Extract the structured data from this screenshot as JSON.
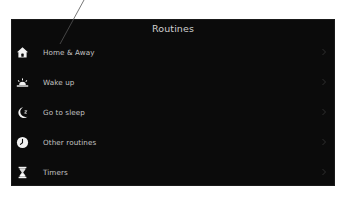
{
  "screen": {
    "title": "Routines",
    "background": "#0b0b0b",
    "text_color": "#c4c4c4",
    "title_color": "#cfcfcf",
    "page_background": "#ffffff"
  },
  "routines": {
    "items": [
      {
        "label": "Home & Away",
        "icon": "home-icon"
      },
      {
        "label": "Wake up",
        "icon": "sunrise-icon"
      },
      {
        "label": "Go to sleep",
        "icon": "moon-sleep-icon"
      },
      {
        "label": "Other routines",
        "icon": "clock-icon"
      },
      {
        "label": "Timers",
        "icon": "hourglass-icon"
      }
    ]
  },
  "annotation": {
    "type": "pointer-line",
    "from": [
      84,
      0
    ],
    "to": [
      60,
      44
    ]
  }
}
